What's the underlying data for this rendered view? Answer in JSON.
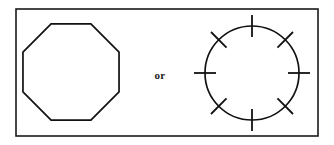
{
  "figure": {
    "caption_text": "or",
    "background_color": "#ffffff",
    "stroke_color": "#111111",
    "frame": {
      "x": 16,
      "y": 9,
      "width": 302,
      "height": 127,
      "stroke_color": "#1a1a1a",
      "stroke_width": 1.6
    },
    "shapes": [
      {
        "name": "octagon",
        "type": "regular-polygon",
        "sides": 8,
        "center_x": 71,
        "center_y": 72,
        "radius": 52,
        "rotation_deg": 22.5,
        "stroke_width": 1.7
      },
      {
        "name": "dashed-circle-with-ticks",
        "type": "circle",
        "center_x": 252,
        "center_y": 73,
        "radius": 47,
        "stroke_width": 1.7,
        "tick_count": 8,
        "tick_angles_deg": [
          0,
          45,
          90,
          135,
          180,
          225,
          270,
          315
        ],
        "tick_inner_offset": 11,
        "tick_outer_offset": 11,
        "tick_stroke_width": 1.8
      }
    ],
    "label": {
      "text": "or",
      "x": 160,
      "y": 76,
      "font_size": 11,
      "font_weight": "bold"
    }
  }
}
